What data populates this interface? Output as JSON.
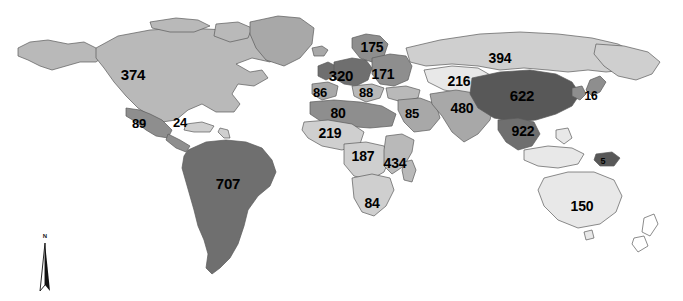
{
  "figure": {
    "type": "choropleth-world-map",
    "title": "",
    "projection": "world-equirectangular",
    "background_color": "#ffffff",
    "border_color": "#555555",
    "ocean_color": "#ffffff"
  },
  "legend_shades": {
    "very_light": "#e8e8e8",
    "light": "#cfcfcf",
    "medium_light": "#b9b9b9",
    "medium": "#a8a8a8",
    "medium_dark": "#8e8e8e",
    "dark": "#6f6f6f",
    "very_dark": "#585858"
  },
  "compass": {
    "label": "N",
    "name": "north-arrow"
  },
  "chart_data": {
    "type": "map",
    "title": "",
    "xlabel": "",
    "ylabel": "",
    "regions": [
      {
        "name": "north-america",
        "value": "374",
        "x": 133,
        "y": 74,
        "font_size": 15,
        "shade": "#b9b9b9"
      },
      {
        "name": "mexico",
        "value": "89",
        "x": 139,
        "y": 123,
        "font_size": 13,
        "shade": "#8e8e8e"
      },
      {
        "name": "caribbean",
        "value": "24",
        "x": 180,
        "y": 122,
        "font_size": 13,
        "shade": "#cfcfcf"
      },
      {
        "name": "south-america",
        "value": "707",
        "x": 228,
        "y": 183,
        "font_size": 15,
        "shade": "#6f6f6f"
      },
      {
        "name": "northern-europe",
        "value": "175",
        "x": 372,
        "y": 47,
        "font_size": 14,
        "shade": "#8e8e8e"
      },
      {
        "name": "western-europe",
        "value": "320",
        "x": 341,
        "y": 75,
        "font_size": 15,
        "shade": "#6f6f6f"
      },
      {
        "name": "eastern-europe",
        "value": "171",
        "x": 383,
        "y": 74,
        "font_size": 14,
        "shade": "#8e8e8e"
      },
      {
        "name": "iberia",
        "value": "86",
        "x": 320,
        "y": 92,
        "font_size": 13,
        "shade": "#a8a8a8"
      },
      {
        "name": "balkans",
        "value": "88",
        "x": 366,
        "y": 92,
        "font_size": 13,
        "shade": "#b9b9b9"
      },
      {
        "name": "north-africa",
        "value": "80",
        "x": 338,
        "y": 113,
        "font_size": 14,
        "shade": "#8e8e8e"
      },
      {
        "name": "west-africa",
        "value": "219",
        "x": 330,
        "y": 133,
        "font_size": 14,
        "shade": "#cfcfcf"
      },
      {
        "name": "middle-east",
        "value": "85",
        "x": 412,
        "y": 113,
        "font_size": 13,
        "shade": "#a8a8a8"
      },
      {
        "name": "central-asia",
        "value": "216",
        "x": 459,
        "y": 81,
        "font_size": 14,
        "shade": "#e8e8e8"
      },
      {
        "name": "south-asia",
        "value": "480",
        "x": 462,
        "y": 108,
        "font_size": 14,
        "shade": "#a8a8a8"
      },
      {
        "name": "russia",
        "value": "394",
        "x": 500,
        "y": 58,
        "font_size": 14,
        "shade": "#cfcfcf"
      },
      {
        "name": "china",
        "value": "622",
        "x": 522,
        "y": 95,
        "font_size": 15,
        "shade": "#585858"
      },
      {
        "name": "japan",
        "value": "16",
        "x": 591,
        "y": 96,
        "font_size": 12,
        "shade": "#8e8e8e"
      },
      {
        "name": "southeast-asia",
        "value": "922",
        "x": 523,
        "y": 131,
        "font_size": 14,
        "shade": "#6f6f6f"
      },
      {
        "name": "central-africa",
        "value": "187",
        "x": 363,
        "y": 156,
        "font_size": 14,
        "shade": "#cfcfcf"
      },
      {
        "name": "east-africa",
        "value": "434",
        "x": 395,
        "y": 163,
        "font_size": 14,
        "shade": "#b9b9b9"
      },
      {
        "name": "southern-africa",
        "value": "84",
        "x": 372,
        "y": 203,
        "font_size": 14,
        "shade": "#cfcfcf"
      },
      {
        "name": "papua-new-guinea",
        "value": "5",
        "x": 603,
        "y": 161,
        "font_size": 9,
        "shade": "#585858"
      },
      {
        "name": "australia",
        "value": "150",
        "x": 582,
        "y": 206,
        "font_size": 14,
        "shade": "#e8e8e8"
      }
    ]
  }
}
